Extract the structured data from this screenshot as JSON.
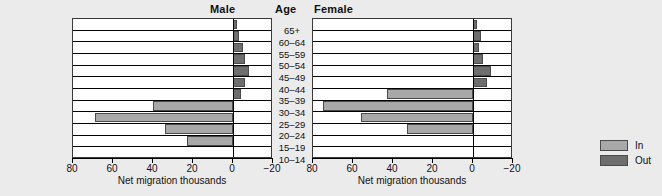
{
  "headers": {
    "male": "Male",
    "age": "Age",
    "female": "Female"
  },
  "axis": {
    "title": "Net migration thousands",
    "ticks": [
      80,
      60,
      40,
      20,
      0,
      -20
    ],
    "tick_labels": [
      "80",
      "60",
      "40",
      "20",
      "0",
      "−20"
    ],
    "min": -20,
    "max": 80
  },
  "legend": {
    "items": [
      {
        "label": "In",
        "color": "#a8a8a8"
      },
      {
        "label": "Out",
        "color": "#6e6e6e"
      }
    ]
  },
  "colors": {
    "in": "#a8a8a8",
    "out": "#6e6e6e",
    "background": "#ebebeb",
    "plot_background": "#ffffff",
    "axis": "#000000"
  },
  "chart_data": {
    "type": "bar",
    "title": "",
    "xlabel": "Net migration thousands",
    "ylabel": "Age",
    "xlim": [
      -20,
      80
    ],
    "grid": false,
    "orientation": "horizontal",
    "legend_position": "right",
    "categories": [
      "65+",
      "60–64",
      "55–59",
      "50–54",
      "45–49",
      "40–44",
      "35–39",
      "30–34",
      "25–29",
      "20–24",
      "15–19",
      "10–14"
    ],
    "panels": [
      {
        "name": "Male",
        "series": [
          {
            "name": "Net migration",
            "values": [
              -2,
              -3,
              -5,
              -6,
              -8,
              -6,
              -4,
              40,
              69,
              34,
              23,
              0
            ],
            "direction": [
              "Out",
              "Out",
              "Out",
              "Out",
              "Out",
              "Out",
              "Out",
              "In",
              "In",
              "In",
              "In",
              "In"
            ]
          }
        ]
      },
      {
        "name": "Female",
        "series": [
          {
            "name": "Net migration",
            "values": [
              -2,
              -4,
              -3,
              -5,
              -9,
              -7,
              43,
              75,
              56,
              33,
              0,
              0
            ],
            "direction": [
              "Out",
              "Out",
              "Out",
              "Out",
              "Out",
              "Out",
              "In",
              "In",
              "In",
              "In",
              "In",
              "In"
            ]
          }
        ]
      }
    ]
  }
}
